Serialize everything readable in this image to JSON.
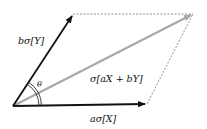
{
  "diagram": {
    "type": "vector-parallelogram",
    "vectors": [
      {
        "id": "aX",
        "label": "aσ[X]",
        "color": "#111111"
      },
      {
        "id": "bY",
        "label": "bσ[Y]",
        "color": "#111111"
      },
      {
        "id": "sum",
        "label": "σ[aX + bY]",
        "color": "#a8a8a8"
      }
    ],
    "angle_label": "θ",
    "dashed_color": "#777777"
  }
}
